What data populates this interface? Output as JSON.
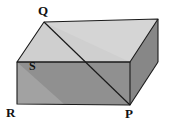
{
  "figure": {
    "shape": "rectangular-prism",
    "background_color": "#ffffff",
    "stroke_color": "#1a1a1a",
    "stroke_width": 1.1,
    "faces": {
      "top_color": "#d5d5d5",
      "top_left_color": "#cfcfcf",
      "front_color": "#909090",
      "front_wedge_color": "#a2a2a2",
      "right_color": "#878787"
    },
    "vertices": {
      "Q": {
        "label": "Q",
        "x": 44,
        "y": 22
      },
      "S": {
        "label": "S",
        "x": 36,
        "y": 66
      },
      "R": {
        "label": "R",
        "x": 17,
        "y": 104
      },
      "P": {
        "label": "P",
        "x": 130,
        "y": 105
      },
      "back_top_right": {
        "x": 158,
        "y": 19
      },
      "front_top_left": {
        "x": 17,
        "y": 62
      },
      "front_top_right": {
        "x": 130,
        "y": 62
      },
      "right_bottom_back": {
        "x": 158,
        "y": 62
      }
    },
    "labels": [
      {
        "name": "vertex-label-Q",
        "text": "Q"
      },
      {
        "name": "vertex-label-S",
        "text": "S"
      },
      {
        "name": "vertex-label-R",
        "text": "R"
      },
      {
        "name": "vertex-label-P",
        "text": "P"
      }
    ],
    "diagonal": {
      "from": "Q",
      "to": "P",
      "visible": true
    }
  }
}
